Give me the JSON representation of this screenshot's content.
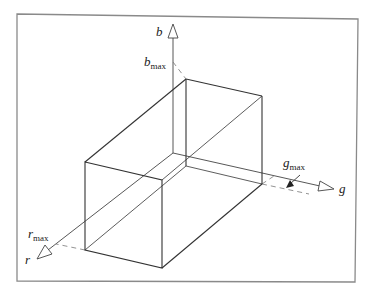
{
  "diagram": {
    "axes": {
      "b": {
        "label": "b",
        "max_label": "b",
        "max_sub": "max"
      },
      "g": {
        "label": "g",
        "max_label": "g",
        "max_sub": "max"
      },
      "r": {
        "label": "r",
        "max_label": "r",
        "max_sub": "max"
      }
    },
    "colors": {
      "frame": "#8a8a8a",
      "line": "#333333",
      "dash": "#666666"
    }
  }
}
